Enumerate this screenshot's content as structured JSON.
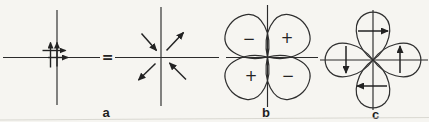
{
  "figure": {
    "background_color": "#f6f5f1",
    "ink_color": "#2b2b2b",
    "equation": {
      "equals": "="
    },
    "panels": {
      "a": {
        "label": "a"
      },
      "b": {
        "label": "b",
        "signs": {
          "top_left": "−",
          "top_right": "+",
          "bottom_left": "+",
          "bottom_right": "−"
        }
      },
      "c": {
        "label": "c"
      }
    }
  }
}
